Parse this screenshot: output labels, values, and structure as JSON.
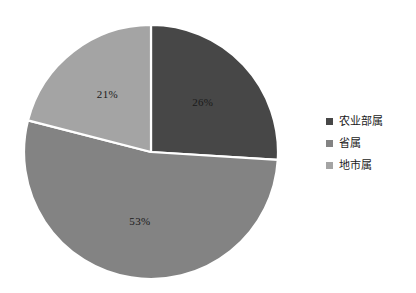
{
  "chart_data": {
    "type": "pie",
    "title": "",
    "subtitle": "",
    "xlabel": "",
    "ylabel": "",
    "grid": false,
    "legend_position": "right",
    "start_angle_deg": 0,
    "direction": "clockwise",
    "categories": [
      "农业部属",
      "省属",
      "地市属"
    ],
    "values": [
      26,
      53,
      21
    ],
    "value_unit": "%",
    "data_labels": [
      "26%",
      "53%",
      "21%"
    ],
    "colors": [
      "#474747",
      "#838383",
      "#a4a4a4"
    ],
    "separator_color": "#ffffff",
    "slices": [
      {
        "label": "农业部属",
        "value": 26,
        "data_label": "26%",
        "color": "#474747"
      },
      {
        "label": "省属",
        "value": 53,
        "data_label": "53%",
        "color": "#838383"
      },
      {
        "label": "地市属",
        "value": 21,
        "data_label": "21%",
        "color": "#a4a4a4"
      }
    ]
  },
  "legend": {
    "items": [
      {
        "label": "农业部属",
        "color": "#474747",
        "marker": "square-marker-icon"
      },
      {
        "label": "省属",
        "color": "#838383",
        "marker": "square-marker-icon"
      },
      {
        "label": "地市属",
        "color": "#a4a4a4",
        "marker": "square-marker-icon"
      }
    ]
  },
  "canvas": {
    "background": "#ffffff"
  }
}
